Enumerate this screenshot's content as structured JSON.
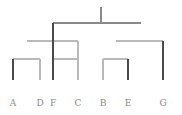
{
  "figure": {
    "title": "",
    "width": 182,
    "height": 115,
    "background": "#ffffff"
  },
  "chart_data": {
    "type": "diagram",
    "subtype": "dendrogram",
    "title": "",
    "xlabel": "",
    "ylabel": "",
    "orientation": "top-down",
    "grid": false,
    "legend": false,
    "leaf_order": [
      "A",
      "D",
      "F",
      "C",
      "B",
      "E",
      "G"
    ],
    "leaves": [
      {
        "label": "A",
        "x": 13,
        "y_bottom": 80,
        "color": "#4a4a4a"
      },
      {
        "label": "D",
        "x": 40,
        "y_bottom": 80,
        "color": "#b9b9b9"
      },
      {
        "label": "F",
        "x": 53,
        "y_bottom": 80,
        "color": "#4a4a4a"
      },
      {
        "label": "C",
        "x": 78,
        "y_bottom": 80,
        "color": "#b9b9b9"
      },
      {
        "label": "B",
        "x": 103,
        "y_bottom": 80,
        "color": "#b9b9b9"
      },
      {
        "label": "E",
        "x": 128,
        "y_bottom": 80,
        "color": "#4a4a4a"
      },
      {
        "label": "G",
        "x": 163,
        "y_bottom": 80,
        "color": "#4a4a4a"
      }
    ],
    "merges": [
      {
        "id": "m1",
        "members": [
          "A",
          "D"
        ],
        "left_x": 13,
        "right_x": 40,
        "height_y": 59,
        "center_x": 27,
        "bar_color": "#b9b9b9",
        "left_stem_color": "#4a4a4a",
        "right_stem_color": "#b9b9b9"
      },
      {
        "id": "m2",
        "members": [
          "F",
          "C"
        ],
        "left_x": 53,
        "right_x": 78,
        "height_y": 59,
        "center_x": 66,
        "bar_color": "#b9b9b9",
        "left_stem_color": "#4a4a4a",
        "right_stem_color": "#b9b9b9"
      },
      {
        "id": "m3",
        "members": [
          "B",
          "E"
        ],
        "left_x": 103,
        "right_x": 128,
        "height_y": 59,
        "center_x": 116,
        "bar_color": "#b9b9b9",
        "left_stem_color": "#b9b9b9",
        "right_stem_color": "#4a4a4a"
      },
      {
        "id": "m4",
        "members": [
          "A",
          "D",
          "F",
          "C"
        ],
        "left_x": 27,
        "right_x": 78,
        "height_y": 41,
        "center_x": 53,
        "bar_color": "#b9b9b9",
        "left_stem_color": "#4a4a4a",
        "right_stem_color": "#555555"
      },
      {
        "id": "m5",
        "members": [
          "B",
          "E",
          "G"
        ],
        "left_x": 116,
        "right_x": 163,
        "height_y": 41,
        "center_x": 140,
        "bar_color": "#b9b9b9",
        "left_stem_color": "#4a4a4a",
        "right_stem_color": "#4a4a4a"
      },
      {
        "id": "m6",
        "members": [
          "A",
          "D",
          "F",
          "C",
          "B",
          "E",
          "G"
        ],
        "left_x": 53,
        "right_x": 141,
        "height_y": 23,
        "center_x": 101,
        "bar_color": "#8a8a8a",
        "left_stem_color": "#555555",
        "right_stem_color": "#b9b9b9"
      }
    ],
    "root_stem": {
      "x": 101,
      "y_top": 7,
      "y_bottom": 23,
      "color": "#8a8a8a"
    },
    "labels_row_y": 99,
    "colors": {
      "dark_branch": "#4a4a4a",
      "mid_branch": "#8a8a8a",
      "light_branch": "#b9b9b9",
      "label_text": "#8a8a8a"
    }
  }
}
